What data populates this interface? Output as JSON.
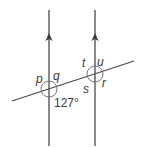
{
  "diagram": {
    "colors": {
      "line": "#4a4a4a",
      "arc": "#6a6a6a",
      "text": "#3a3a3a",
      "background": "#ffffff"
    },
    "parallel_lines": [
      {
        "id": "left",
        "x": 49,
        "y_top": 10,
        "y_bottom": 146,
        "arrow_y": 38,
        "arrow_direction": "up"
      },
      {
        "id": "right",
        "x": 95,
        "y_top": 10,
        "y_bottom": 146,
        "arrow_y": 38,
        "arrow_direction": "up"
      }
    ],
    "transversal": {
      "x1": 12,
      "y1": 101,
      "x2": 134,
      "y2": 61
    },
    "intersections": [
      {
        "id": "left",
        "cx": 49,
        "cy": 89,
        "r": 8,
        "labels": [
          {
            "text": "p",
            "x": 36,
            "y": 83,
            "italic": true
          },
          {
            "text": "q",
            "x": 53,
            "y": 80,
            "italic": true
          },
          {
            "text": "127°",
            "x": 54,
            "y": 107,
            "italic": false
          }
        ]
      },
      {
        "id": "right",
        "cx": 95,
        "cy": 74,
        "r": 8,
        "labels": [
          {
            "text": "t",
            "x": 82,
            "y": 67,
            "italic": true
          },
          {
            "text": "u",
            "x": 97,
            "y": 66,
            "italic": true
          },
          {
            "text": "s",
            "x": 83,
            "y": 93,
            "italic": true
          },
          {
            "text": "r",
            "x": 102,
            "y": 87,
            "italic": true
          }
        ]
      }
    ],
    "labels": {
      "p": "p",
      "q": "q",
      "angle_given": "127°",
      "t": "t",
      "u": "u",
      "s": "s",
      "r": "r"
    }
  }
}
